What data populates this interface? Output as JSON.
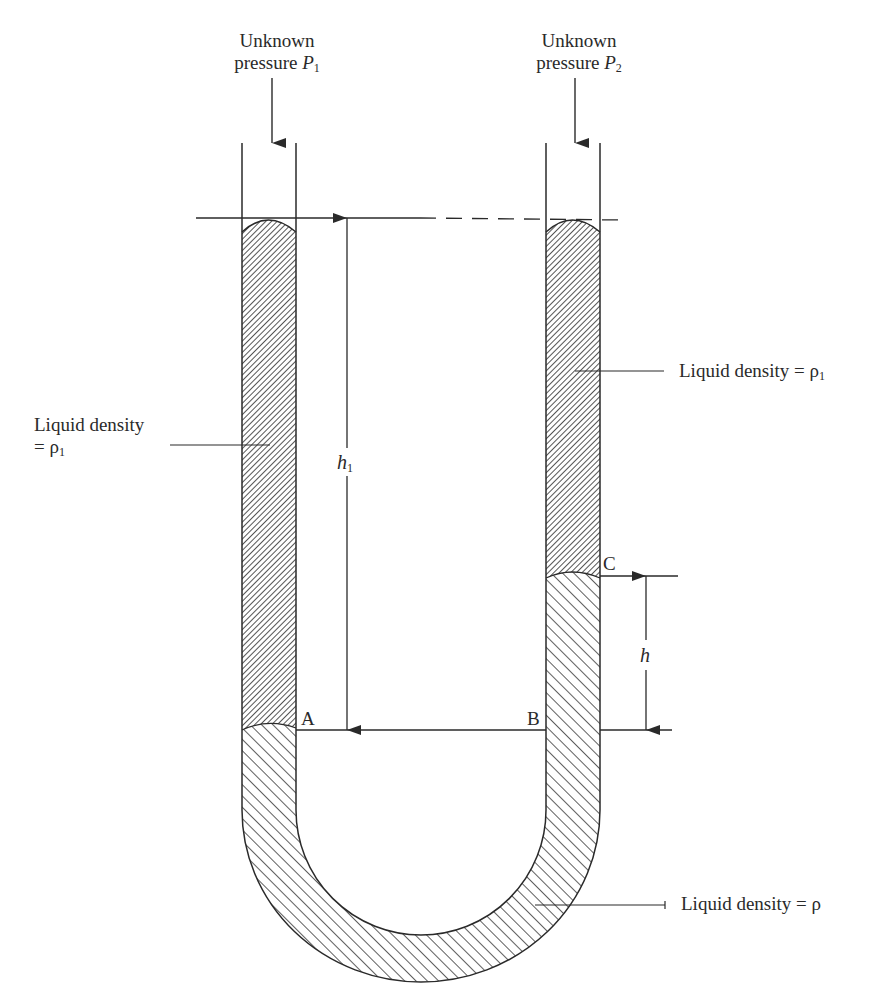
{
  "diagram": {
    "type": "U-tube differential manometer",
    "labels": {
      "p1_line1": "Unknown",
      "p1_line2": "pressure ",
      "p1_symbol": "P",
      "p1_sub": "1",
      "p2_line1": "Unknown",
      "p2_line2": "pressure ",
      "p2_symbol": "P",
      "p2_sub": "2",
      "left_liquid_line1": "Liquid density",
      "left_liquid_line2": "= ρ",
      "left_liquid_sub": "1",
      "right_liquid_text": "Liquid density = ρ",
      "right_liquid_sub": "1",
      "bottom_liquid_text": "Liquid density = ρ",
      "h1_symbol": "h",
      "h1_sub": "1",
      "h_symbol": "h",
      "point_a": "A",
      "point_b": "B",
      "point_c": "C"
    },
    "colors": {
      "stroke": "#2a2a2a",
      "background": "#ffffff"
    }
  }
}
